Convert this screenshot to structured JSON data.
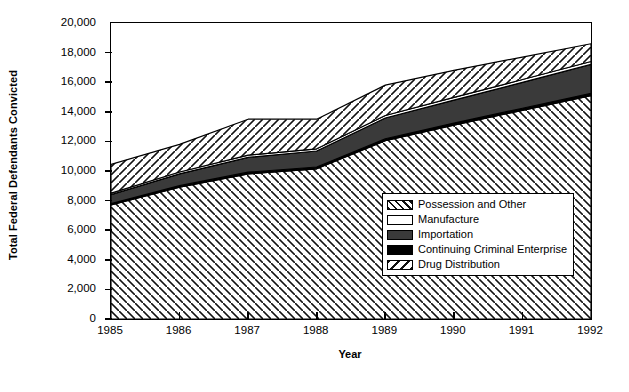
{
  "chart_data": {
    "type": "area",
    "title": "",
    "xlabel": "Year",
    "ylabel": "Total Federal Defendants Convicted",
    "categories": [
      "1985",
      "1986",
      "1987",
      "1988",
      "1989",
      "1990",
      "1991",
      "1992"
    ],
    "x": [
      1985,
      1986,
      1987,
      1988,
      1989,
      1990,
      1991,
      1992
    ],
    "ylim": [
      0,
      20000
    ],
    "xlim": [
      1985,
      1992
    ],
    "ytick_labels": [
      "0",
      "2,000",
      "4,000",
      "6,000",
      "8,000",
      "10,000",
      "12,000",
      "14,000",
      "16,000",
      "18,000",
      "20,000"
    ],
    "ytick_values": [
      0,
      2000,
      4000,
      6000,
      8000,
      10000,
      12000,
      14000,
      16000,
      18000,
      20000
    ],
    "grid": false,
    "stacked": true,
    "legend_position": "inside-lower-right",
    "series": [
      {
        "name": "Drug Distribution",
        "pattern": "diagonal-hatch-backslash",
        "color": "#ffffff",
        "values": [
          7700,
          8900,
          9800,
          10150,
          12050,
          13100,
          14100,
          15100
        ]
      },
      {
        "name": "Continuing Criminal Enterprise",
        "pattern": "solid-black",
        "color": "#000000",
        "values": [
          100,
          110,
          120,
          120,
          130,
          140,
          140,
          150
        ]
      },
      {
        "name": "Importation",
        "pattern": "solid-dark-gray",
        "color": "#3a3a3a",
        "values": [
          600,
          800,
          1000,
          1080,
          1400,
          1550,
          1750,
          1950
        ]
      },
      {
        "name": "Manufacture",
        "pattern": "solid-white",
        "color": "#ffffff",
        "values": [
          100,
          120,
          150,
          150,
          170,
          180,
          190,
          200
        ]
      },
      {
        "name": "Possession and Other",
        "pattern": "diagonal-hatch-slash",
        "color": "#ffffff",
        "values": [
          1950,
          1870,
          2430,
          2000,
          2050,
          1830,
          1520,
          1200
        ]
      }
    ],
    "cumulative_totals": [
      10450,
      11800,
      13500,
      13500,
      15800,
      16800,
      17700,
      18600
    ],
    "legend": [
      {
        "label": "Possession and Other",
        "pattern": "diagonal-hatch-slash"
      },
      {
        "label": "Manufacture",
        "pattern": "solid-white"
      },
      {
        "label": "Importation",
        "pattern": "solid-dark-gray"
      },
      {
        "label": "Continuing Criminal Enterprise",
        "pattern": "solid-black"
      },
      {
        "label": "Drug Distribution",
        "pattern": "diagonal-hatch-backslash"
      }
    ]
  }
}
